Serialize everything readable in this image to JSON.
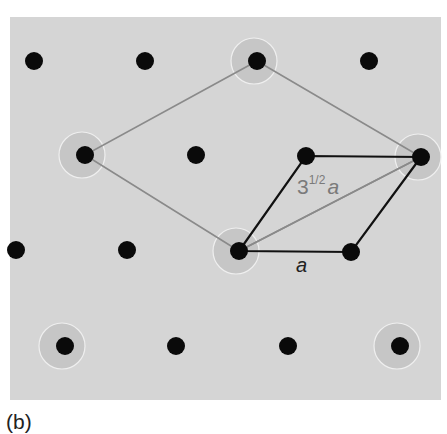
{
  "figure": {
    "panel_label": "(b)",
    "colors": {
      "background": "#ffffff",
      "panel": "#d5d5d5",
      "ring": "#c6c6c6",
      "ring_highlight": "#efefef",
      "atom": "#0a0a0a",
      "large_cell_line": "#8a8a8a",
      "small_cell_line": "#111111",
      "diagonal_line": "#8a8a8a",
      "label_gray": "#7a7a7a",
      "label_dark": "#222222"
    },
    "panel": {
      "x": 10,
      "y": 17,
      "width": 431,
      "height": 383
    },
    "atoms": [
      {
        "x": 34,
        "y": 61,
        "ringed": false
      },
      {
        "x": 145,
        "y": 61,
        "ringed": false
      },
      {
        "x": 257,
        "y": 61,
        "ringed": true
      },
      {
        "x": 369,
        "y": 61,
        "ringed": false
      },
      {
        "x": 85,
        "y": 155,
        "ringed": true
      },
      {
        "x": 196,
        "y": 155,
        "ringed": false
      },
      {
        "x": 306,
        "y": 156,
        "ringed": false
      },
      {
        "x": 421,
        "y": 157,
        "ringed": true
      },
      {
        "x": 16,
        "y": 250,
        "ringed": false
      },
      {
        "x": 127,
        "y": 250,
        "ringed": false
      },
      {
        "x": 239,
        "y": 251,
        "ringed": true
      },
      {
        "x": 351,
        "y": 252,
        "ringed": false
      },
      {
        "x": 65,
        "y": 346,
        "ringed": true
      },
      {
        "x": 176,
        "y": 346,
        "ringed": false
      },
      {
        "x": 288,
        "y": 346,
        "ringed": false
      },
      {
        "x": 400,
        "y": 346,
        "ringed": true
      }
    ],
    "large_cell": [
      [
        257,
        61
      ],
      [
        421,
        157
      ],
      [
        239,
        251
      ],
      [
        85,
        155
      ]
    ],
    "small_cell": [
      [
        239,
        251
      ],
      [
        351,
        252
      ],
      [
        421,
        157
      ],
      [
        306,
        156
      ]
    ],
    "diagonal": [
      [
        239,
        251
      ],
      [
        421,
        157
      ]
    ],
    "labels": {
      "long_base": "3",
      "long_exp": "1/2",
      "long_var": "a",
      "short_var": "a"
    }
  }
}
